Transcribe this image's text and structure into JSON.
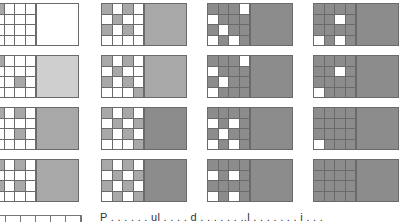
{
  "figure": {
    "columns": 4,
    "rows": 4,
    "panels": [
      {
        "row": 0,
        "col": 0,
        "x": -7,
        "y": 3,
        "block": "#ffffff",
        "cells": "gwww wwww wwww wwww"
      },
      {
        "row": 0,
        "col": 1,
        "x": 101,
        "y": 3,
        "block": "#a8a8a8",
        "cells": "gwgw wgww gwgw wwww"
      },
      {
        "row": 0,
        "col": 2,
        "x": 207,
        "y": 3,
        "block": "#8c8c8c",
        "cells": "dddw wddd dwdd wdwd"
      },
      {
        "row": 0,
        "col": 3,
        "x": 313,
        "y": 3,
        "block": "#8c8c8c",
        "cells": "dddd ddwd dddd wdwd"
      },
      {
        "row": 1,
        "col": 0,
        "x": -7,
        "y": 55,
        "block": "#cfcfcf",
        "cells": "gwww wwww wwgw wwww"
      },
      {
        "row": 1,
        "col": 1,
        "x": 101,
        "y": 55,
        "block": "#a8a8a8",
        "cells": "gwgw wgww gwgw wwwg"
      },
      {
        "row": 1,
        "col": 2,
        "x": 207,
        "y": 55,
        "block": "#8c8c8c",
        "cells": "dddw wddd dwdd wddd"
      },
      {
        "row": 1,
        "col": 3,
        "x": 313,
        "y": 55,
        "block": "#8c8c8c",
        "cells": "dddd ddwd dddd wddd"
      },
      {
        "row": 2,
        "col": 0,
        "x": -7,
        "y": 107,
        "block": "#a8a8a8",
        "cells": "gwgw wwww wwgw wwww"
      },
      {
        "row": 2,
        "col": 1,
        "x": 101,
        "y": 107,
        "block": "#8c8c8c",
        "cells": "gwgw wgwg gwgw wwwg"
      },
      {
        "row": 2,
        "col": 2,
        "x": 207,
        "y": 107,
        "block": "#8c8c8c",
        "cells": "dddd wdwd dwdd wdwd"
      },
      {
        "row": 2,
        "col": 3,
        "x": 313,
        "y": 107,
        "block": "#8c8c8c",
        "cells": "dddd dddd dddd wddd"
      },
      {
        "row": 3,
        "col": 0,
        "x": -7,
        "y": 159,
        "block": "#a8a8a8",
        "cells": "gwgw wwww gwgw wwww"
      },
      {
        "row": 3,
        "col": 1,
        "x": 101,
        "y": 159,
        "block": "#8c8c8c",
        "cells": "gwgw wgwg gwgw wgwg"
      },
      {
        "row": 3,
        "col": 2,
        "x": 207,
        "y": 159,
        "block": "#8c8c8c",
        "cells": "dddd wdwd dddd wdwd"
      },
      {
        "row": 3,
        "col": 3,
        "x": 313,
        "y": 159,
        "block": "#8c8c8c",
        "cells": "dddd dddd dddd dddd"
      }
    ]
  },
  "caption": {
    "text": "P . . . . . . ul . . . . d . . . . . . ..l . . . . . . . i . . ."
  }
}
